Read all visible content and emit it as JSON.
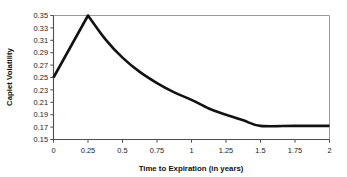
{
  "chart_data": {
    "type": "line",
    "title": "",
    "xlabel": "Time to Expiration (in years)",
    "ylabel": "Caplet Volatility",
    "xlim": [
      0,
      2
    ],
    "ylim": [
      0.15,
      0.35
    ],
    "grid": false,
    "legend": null,
    "legend_position": "none",
    "xticks": [
      "0",
      "0.25",
      "0.5",
      "0.75",
      "1",
      "1.25",
      "1.5",
      "1.75",
      "2"
    ],
    "xtick_values": [
      0,
      0.25,
      0.5,
      0.75,
      1,
      1.25,
      1.5,
      1.75,
      2
    ],
    "yticks": [
      "0.15",
      "0.17",
      "0.19",
      "0.21",
      "0.23",
      "0.25",
      "0.27",
      "0.29",
      "0.31",
      "0.33",
      "0.35"
    ],
    "ytick_values": [
      0.15,
      0.17,
      0.19,
      0.21,
      0.23,
      0.25,
      0.27,
      0.29,
      0.31,
      0.33,
      0.35
    ],
    "series": [
      {
        "name": "Caplet Volatility",
        "color": "#121212",
        "x": [
          0,
          0.25,
          0.375,
          0.5,
          0.625,
          0.75,
          0.875,
          1,
          1.125,
          1.25,
          1.375,
          1.5,
          1.75,
          2
        ],
        "values": [
          0.25,
          0.35,
          0.312,
          0.282,
          0.259,
          0.241,
          0.226,
          0.214,
          0.2,
          0.19,
          0.181,
          0.172,
          0.172,
          0.172
        ]
      }
    ]
  },
  "axes": {
    "x_title": "Time to Expiration (in years)",
    "y_title": "Caplet Volatility"
  }
}
